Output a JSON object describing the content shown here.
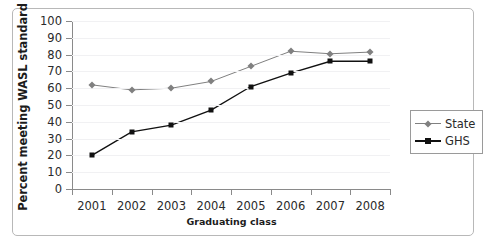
{
  "chart_data": {
    "type": "line",
    "title": "",
    "xlabel": "Graduating class",
    "ylabel": "Percent meeting WASL standard",
    "categories": [
      "2001",
      "2002",
      "2003",
      "2004",
      "2005",
      "2006",
      "2007",
      "2008"
    ],
    "series": [
      {
        "name": "State",
        "color": "#808080",
        "marker": "diamond",
        "values": [
          62,
          59,
          60,
          64,
          73,
          82,
          80.5,
          81.5
        ]
      },
      {
        "name": "GHS",
        "color": "#111111",
        "marker": "square",
        "values": [
          20,
          34,
          38,
          47,
          61,
          69,
          76,
          76
        ]
      }
    ],
    "ylim": [
      0,
      100
    ],
    "yticks": [
      0,
      10,
      20,
      30,
      40,
      50,
      60,
      70,
      80,
      90,
      100
    ],
    "ytick_labels": [
      "0",
      "10",
      "20",
      "30",
      "40",
      "50",
      "60",
      "70",
      "80",
      "90",
      "100"
    ],
    "grid": true,
    "grid_color": "#f1f1f3",
    "legend_position": "right",
    "axis_color": "#8a8a8a",
    "frame_color": "#b8b8b8",
    "background": "#ffffff"
  }
}
